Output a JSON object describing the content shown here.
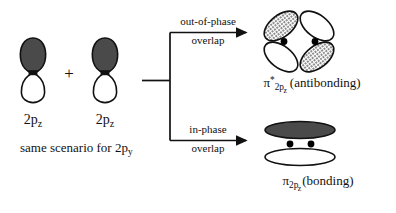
{
  "figure": {
    "title_visible": false,
    "background_color": "#ffffff",
    "ink_color": "#000000"
  },
  "colors": {
    "lobe_dark": "#4a4a4a",
    "lobe_light": "#ffffff",
    "outline": "#111111",
    "hatch": "#6d6d6d",
    "bonding_fill": "#4a4a4a",
    "electron_dot": "#000000"
  },
  "reactants": {
    "orbital_left": {
      "label_pi": "2p",
      "label_sub": "z",
      "top_lobe_shading": "dark",
      "bottom_lobe_shading": "light"
    },
    "orbital_right": {
      "label_pi": "2p",
      "label_sub": "z",
      "top_lobe_shading": "dark",
      "bottom_lobe_shading": "light"
    },
    "plus": "+",
    "footnote_text": "same scenario for 2p",
    "footnote_sub": "y"
  },
  "branches": [
    {
      "id": "out-of-phase",
      "line1": "out-of-phase",
      "line2": "overlap",
      "product": {
        "symbol": "π",
        "superscript": "*",
        "sub": "2p",
        "subsub": "z",
        "suffix": "(antibonding)",
        "lobes": [
          {
            "position": "top-left",
            "shading": "hatched"
          },
          {
            "position": "top-right",
            "shading": "light"
          },
          {
            "position": "bottom-left",
            "shading": "light"
          },
          {
            "position": "bottom-right",
            "shading": "hatched"
          }
        ],
        "electron_dots": 2
      }
    },
    {
      "id": "in-phase",
      "line1": "in-phase",
      "line2": "overlap",
      "product": {
        "symbol": "π",
        "superscript": "",
        "sub": "2p",
        "subsub": "z",
        "suffix": "(bonding)",
        "lobes": [
          {
            "position": "top",
            "shading": "dark"
          },
          {
            "position": "bottom",
            "shading": "light"
          }
        ],
        "electron_dots": 2
      }
    }
  ]
}
